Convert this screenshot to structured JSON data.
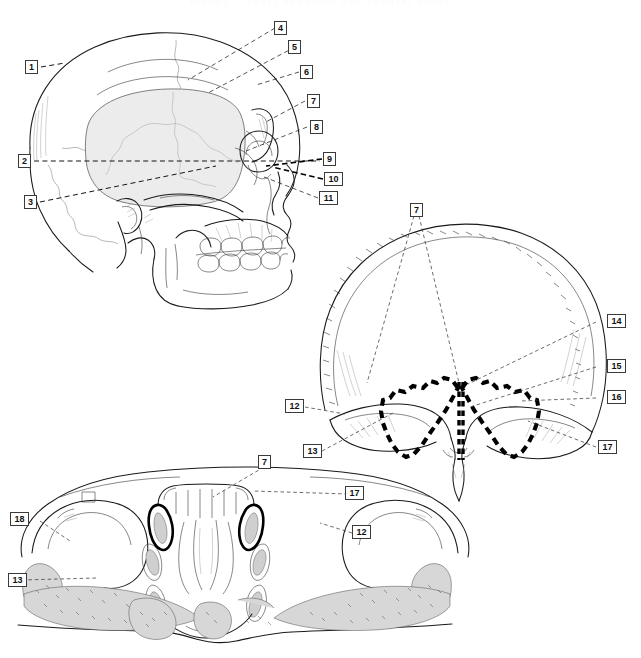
{
  "page": {
    "ghost_title": "FIGURE  —  SKULL  SECTIONS  AND  FRONTAL  SINUS",
    "background": "#ffffff",
    "ink": "#111111",
    "cavity_fill": "#ececec",
    "sinus_outline": "#000000",
    "width": 641,
    "height": 658
  },
  "figures": [
    {
      "id": "lateral-skull",
      "name": "lateral-skull-view",
      "callouts": [
        "1",
        "2",
        "3",
        "4",
        "5",
        "6",
        "7",
        "8",
        "9",
        "10",
        "11"
      ]
    },
    {
      "id": "frontal-bone",
      "name": "anterior-frontal-bone-view",
      "callouts": [
        "7",
        "12",
        "13",
        "14",
        "15",
        "16",
        "17"
      ]
    },
    {
      "id": "axial-section",
      "name": "transverse-section-view",
      "callouts": [
        "7",
        "12",
        "13",
        "17",
        "18"
      ]
    }
  ],
  "labels": {
    "l1": "1",
    "l2": "2",
    "l3": "3",
    "l4": "4",
    "l5": "5",
    "l6": "6",
    "l7": "7",
    "l8": "8",
    "l9": "9",
    "l10": "10",
    "l11": "11",
    "f7": "7",
    "f12": "12",
    "f13": "13",
    "f14": "14",
    "f15": "15",
    "f16": "16",
    "f17": "17",
    "a7": "7",
    "a12": "12",
    "a13": "13",
    "a17": "17",
    "a18": "18"
  }
}
